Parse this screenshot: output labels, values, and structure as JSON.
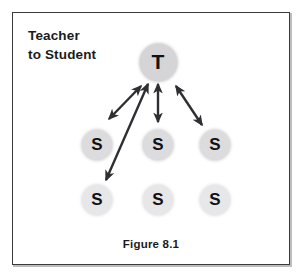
{
  "figure": {
    "title_line1": "Teacher",
    "title_line2": "to Student",
    "caption": "Figure 8.1",
    "border_color": "#3a3a3c",
    "background": "#ffffff",
    "arrow_color": "#2f2f33"
  },
  "nodes": {
    "teacher": {
      "label": "T",
      "x": 158,
      "y": 62,
      "radius": 18.5,
      "fill": "#d5d5d7"
    },
    "students": [
      {
        "label": "S",
        "x": 97,
        "y": 145,
        "radius": 15,
        "fill": "#dcdcde",
        "row": "middle"
      },
      {
        "label": "S",
        "x": 158,
        "y": 145,
        "radius": 15,
        "fill": "#dcdcde",
        "row": "middle"
      },
      {
        "label": "S",
        "x": 215,
        "y": 145,
        "radius": 15,
        "fill": "#dcdcde",
        "row": "middle"
      },
      {
        "label": "S",
        "x": 97,
        "y": 200,
        "radius": 15,
        "fill": "#e7e7e9",
        "row": "bottom"
      },
      {
        "label": "S",
        "x": 158,
        "y": 200,
        "radius": 15,
        "fill": "#e7e7e9",
        "row": "bottom"
      },
      {
        "label": "S",
        "x": 215,
        "y": 200,
        "radius": 15,
        "fill": "#e7e7e9",
        "row": "bottom"
      }
    ]
  },
  "arrows": [
    {
      "name": "teacher-to-left-student",
      "x1": 141,
      "y1": 86,
      "x2": 109,
      "y2": 119,
      "double": true
    },
    {
      "name": "teacher-to-bottom-left-student",
      "x1": 148,
      "y1": 84,
      "x2": 106,
      "y2": 180,
      "double": true
    },
    {
      "name": "teacher-to-center-student",
      "x1": 158,
      "y1": 84,
      "x2": 158,
      "y2": 122,
      "double": true
    },
    {
      "name": "teacher-to-right-student",
      "x1": 176,
      "y1": 86,
      "x2": 202,
      "y2": 125,
      "double": true
    }
  ]
}
